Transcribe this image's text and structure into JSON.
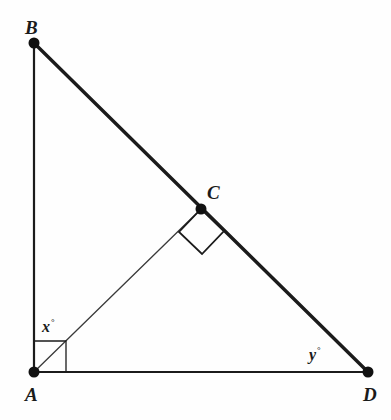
{
  "figure": {
    "type": "geometry-diagram",
    "background_color": "#fefefe",
    "stroke_color": "#1b1b1b",
    "width": 391,
    "height": 420,
    "vertices": [
      {
        "id": "A",
        "label": "A",
        "x": 34,
        "y": 372,
        "dot": true,
        "dot_radius": 5.5
      },
      {
        "id": "B",
        "label": "B",
        "x": 34,
        "y": 43,
        "dot": true,
        "dot_radius": 5.5
      },
      {
        "id": "C",
        "label": "C",
        "x": 201,
        "y": 209,
        "dot": true,
        "dot_radius": 5.5
      },
      {
        "id": "D",
        "label": "D",
        "x": 368,
        "y": 372,
        "dot": true,
        "dot_radius": 5.5
      }
    ],
    "segments": [
      {
        "id": "AB",
        "from": "A",
        "to": "B",
        "width": 2.2,
        "note": "vertical leg"
      },
      {
        "id": "AD",
        "from": "A",
        "to": "D",
        "width": 2.2,
        "note": "horizontal leg"
      },
      {
        "id": "BD",
        "from": "B",
        "to": "D",
        "width": 3.4,
        "note": "hypotenuse through C"
      },
      {
        "id": "AC",
        "from": "A",
        "to": "C",
        "width": 1.3,
        "note": "altitude from A to BD"
      }
    ],
    "right_angle_marks": [
      {
        "id": "right-angle-at-A",
        "at": "A",
        "style": "square",
        "points": "34,341 66,341 66,372",
        "size": 32
      },
      {
        "id": "right-angle-at-C",
        "at": "C",
        "style": "rotated-square",
        "points": "201,209 179,232 202,254 224,231",
        "size": 32
      }
    ],
    "angle_labels": [
      {
        "id": "x",
        "variable": "x",
        "degree_symbol": "°",
        "text": "x°",
        "at_vertex": "A",
        "x": 42,
        "y": 319
      },
      {
        "id": "y",
        "variable": "y",
        "degree_symbol": "°",
        "text": "y°",
        "at_vertex": "D",
        "x": 309,
        "y": 347
      }
    ]
  },
  "labels": {
    "A": "A",
    "B": "B",
    "C": "C",
    "D": "D",
    "x_angle": "x",
    "y_angle": "y",
    "degree": "°"
  }
}
